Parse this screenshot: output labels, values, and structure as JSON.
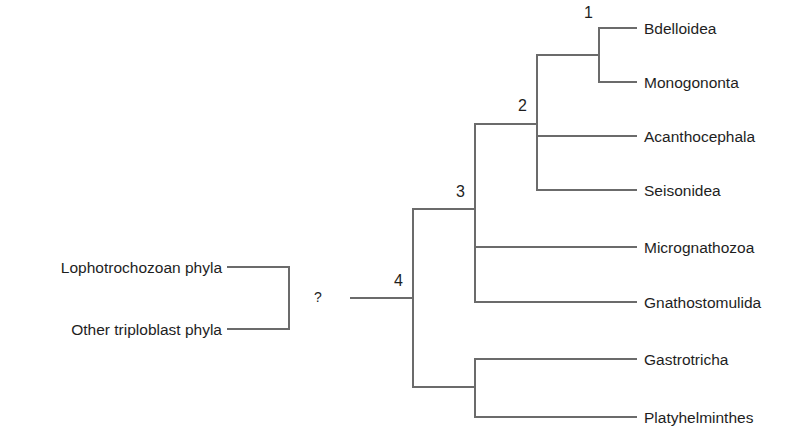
{
  "diagram": {
    "type": "phylogenetic-tree",
    "line_color": "#6b6b6b",
    "text_color": "#1e1e1e",
    "outgroups": [
      {
        "label": "Lophotrochozoan phyla"
      },
      {
        "label": "Other triploblast phyla"
      }
    ],
    "uncertain_link": "?",
    "nodes": [
      {
        "id": "1",
        "label": "1"
      },
      {
        "id": "2",
        "label": "2"
      },
      {
        "id": "3",
        "label": "3"
      },
      {
        "id": "4",
        "label": "4"
      }
    ],
    "taxa": [
      {
        "label": "Bdelloidea"
      },
      {
        "label": "Monogononta"
      },
      {
        "label": "Acanthocephala"
      },
      {
        "label": "Seisonidea"
      },
      {
        "label": "Micrognathozoa"
      },
      {
        "label": "Gnathostomulida"
      },
      {
        "label": "Gastrotricha"
      },
      {
        "label": "Platyhelminthes"
      }
    ],
    "topology": "((((Bdelloidea,Monogononta)1,Acanthocephala,Seisonidea)2,Micrognathozoa,Gnathostomulida)3,(Gastrotricha,Platyhelminthes))4 ? (Lophotrochozoan phyla, Other triploblast phyla)"
  }
}
